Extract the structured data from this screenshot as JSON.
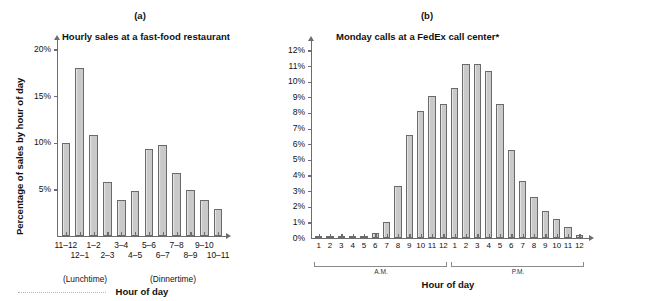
{
  "figure": {
    "panels": [
      {
        "letter": "(a)",
        "title": "Hourly sales at a fast-food restaurant",
        "ylabel": "Percentage of sales by hour of day",
        "xlabel": "Hour of day",
        "annotations": [
          "(Lunchtime)",
          "(Dinnertime)"
        ]
      },
      {
        "letter": "(b)",
        "title": "Monday calls at a FedEx call center*",
        "ylabel": "",
        "xlabel": "Hour of day",
        "brackets": [
          "A.M.",
          "P.M."
        ]
      }
    ]
  },
  "chart_data": [
    {
      "type": "bar",
      "title": "Hourly sales at a fast-food restaurant",
      "panel": "(a)",
      "xlabel": "Hour of day",
      "ylabel": "Percentage of sales by hour of day",
      "categories": [
        "11–12",
        "12–1",
        "1–2",
        "2–3",
        "3–4",
        "4–5",
        "5–6",
        "6–7",
        "7–8",
        "8–9",
        "9–10",
        "10–11"
      ],
      "values": [
        10.0,
        18.0,
        10.8,
        5.8,
        3.9,
        4.8,
        9.3,
        9.8,
        6.8,
        4.9,
        3.9,
        2.9
      ],
      "ylim": [
        0,
        21
      ],
      "yticks": [
        5,
        10,
        15,
        20
      ],
      "ytick_labels": [
        "5%",
        "10%",
        "15%",
        "20%"
      ],
      "grid": false,
      "legend": "none",
      "annotations": [
        {
          "text": "(Lunchtime)",
          "under": "11–12 / 12–1"
        },
        {
          "text": "(Dinnertime)",
          "under": "5–6 / 6–7"
        }
      ]
    },
    {
      "type": "bar",
      "title": "Monday calls at a FedEx call center*",
      "panel": "(b)",
      "xlabel": "Hour of day",
      "ylabel": "",
      "categories": [
        "1",
        "2",
        "3",
        "4",
        "5",
        "6",
        "7",
        "8",
        "9",
        "10",
        "11",
        "12",
        "1",
        "2",
        "3",
        "4",
        "5",
        "6",
        "7",
        "8",
        "9",
        "10",
        "11",
        "12"
      ],
      "period_groups": [
        {
          "label": "A.M.",
          "hours": [
            "1",
            "2",
            "3",
            "4",
            "5",
            "6",
            "7",
            "8",
            "9",
            "10",
            "11",
            "12"
          ]
        },
        {
          "label": "P.M.",
          "hours": [
            "1",
            "2",
            "3",
            "4",
            "5",
            "6",
            "7",
            "8",
            "9",
            "10",
            "11",
            "12"
          ]
        }
      ],
      "values": [
        0.15,
        0.15,
        0.15,
        0.15,
        0.1,
        0.3,
        1.05,
        3.3,
        6.6,
        8.1,
        9.1,
        8.6,
        9.6,
        11.1,
        11.1,
        10.65,
        8.6,
        5.65,
        3.65,
        2.65,
        1.7,
        1.2,
        0.7,
        0.2
      ],
      "ylim": [
        0,
        12.6
      ],
      "yticks": [
        0,
        1,
        2,
        3,
        4,
        5,
        6,
        7,
        8,
        9,
        10,
        11,
        12
      ],
      "ytick_labels": [
        "0%",
        "1%",
        "2%",
        "3%",
        "4%",
        "5%",
        "6%",
        "7%",
        "8%",
        "9%",
        "10%",
        "11%",
        "12%"
      ],
      "grid": false,
      "legend": "none"
    }
  ],
  "style": {
    "bar_fill": "#c9c9c9",
    "bar_stroke": "#6a6a6a",
    "axis_color": "#6d6d6d",
    "text_color": "#111111",
    "background": "#ffffff"
  }
}
